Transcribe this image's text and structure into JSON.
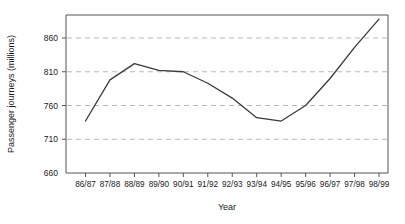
{
  "chart_data": {
    "type": "line",
    "title": "",
    "subtitle": "",
    "xlabel": "Year",
    "ylabel": "Passenger journeys (millions)",
    "categories": [
      "86/87",
      "87/88",
      "88/89",
      "89/90",
      "90/91",
      "91/92",
      "92/93",
      "93/94",
      "94/95",
      "95/96",
      "96/97",
      "97/98",
      "98/99"
    ],
    "values": [
      737,
      798,
      822,
      812,
      810,
      793,
      771,
      742,
      737,
      760,
      800,
      846,
      888
    ],
    "series": [
      {
        "name": "Passenger journeys",
        "values": [
          737,
          798,
          822,
          812,
          810,
          793,
          771,
          742,
          737,
          760,
          800,
          846,
          888
        ]
      }
    ],
    "ylim": [
      660,
      900
    ],
    "xlim": [
      0,
      12
    ],
    "yticks": [
      660,
      710,
      760,
      810,
      860
    ],
    "ytick_labels": [
      "660",
      "710",
      "760",
      "810",
      "860"
    ],
    "grid": true,
    "grid_axis": "y",
    "grid_style": "dashed",
    "legend": false,
    "legend_position": "none",
    "line_color": "#3a3a3a",
    "grid_color": "#b8b8b8",
    "axis_color": "#555555",
    "background_color": "#ffffff"
  }
}
